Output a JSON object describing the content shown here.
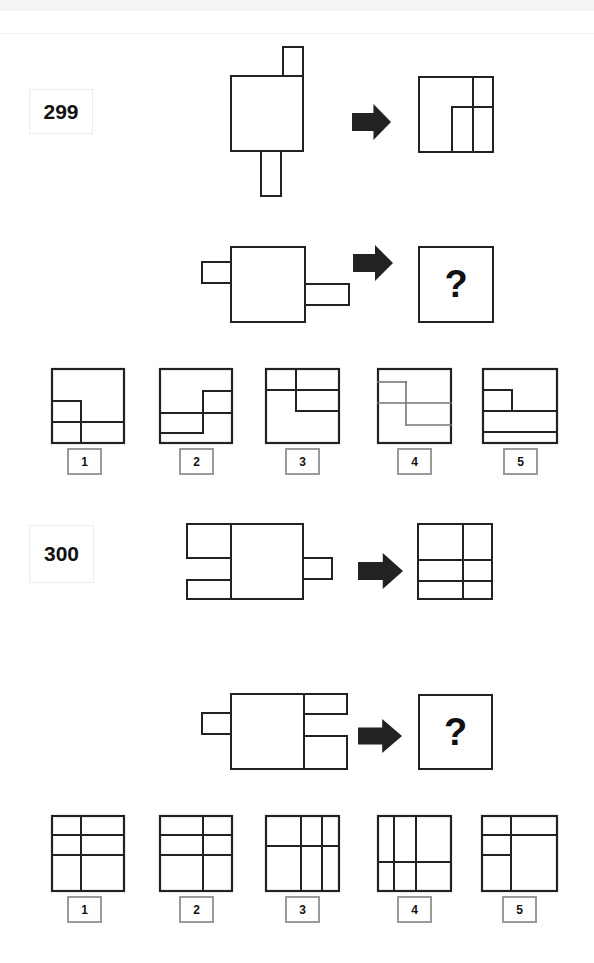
{
  "puzzles": [
    {
      "number": "299",
      "number_box": {
        "x": 29,
        "y": 89,
        "w": 64,
        "h": 45
      },
      "example": {
        "source": {
          "rects": [
            {
              "x": 231,
              "y": 76,
              "w": 72,
              "h": 75
            },
            {
              "x": 283,
              "y": 47,
              "w": 20,
              "h": 29
            },
            {
              "x": 261,
              "y": 151,
              "w": 20,
              "h": 45
            }
          ]
        },
        "arrow": {
          "x": 352,
          "y": 104,
          "w": 39,
          "h": 36
        },
        "result": {
          "box": {
            "x": 419,
            "y": 77,
            "w": 74,
            "h": 75
          },
          "lines": [
            [
              473,
              77,
              473,
              152
            ],
            [
              452,
              107,
              452,
              152
            ],
            [
              452,
              107,
              493,
              107
            ]
          ]
        }
      },
      "question": {
        "source": {
          "rects": [
            {
              "x": 231,
              "y": 247,
              "w": 74,
              "h": 75
            },
            {
              "x": 202,
              "y": 262,
              "w": 29,
              "h": 21
            },
            {
              "x": 305,
              "y": 284,
              "w": 44,
              "h": 21
            }
          ]
        },
        "arrow": {
          "x": 353,
          "y": 245,
          "w": 40,
          "h": 36
        },
        "answer_box": {
          "x": 419,
          "y": 247,
          "w": 74,
          "h": 75
        },
        "answer_glyph": "?"
      },
      "options": [
        {
          "label": "1",
          "box": {
            "x": 52,
            "y": 369,
            "w": 72,
            "h": 74
          },
          "label_pos": {
            "x": 67,
            "y": 448
          },
          "line_color": "#222",
          "lines": [
            [
              81,
              401,
              81,
              443
            ],
            [
              52,
              401,
              81,
              401
            ],
            [
              52,
              422,
              124,
              422
            ]
          ]
        },
        {
          "label": "2",
          "box": {
            "x": 160,
            "y": 369,
            "w": 72,
            "h": 74
          },
          "label_pos": {
            "x": 179,
            "y": 448
          },
          "line_color": "#222",
          "lines": [
            [
              203,
              391,
              232,
              391
            ],
            [
              203,
              391,
              203,
              433
            ],
            [
              160,
              413,
              232,
              413
            ],
            [
              160,
              433,
              203,
              433
            ]
          ]
        },
        {
          "label": "3",
          "box": {
            "x": 266,
            "y": 369,
            "w": 73,
            "h": 74
          },
          "label_pos": {
            "x": 285,
            "y": 448
          },
          "line_color": "#222",
          "lines": [
            [
              296,
              369,
              296,
              411
            ],
            [
              266,
              390,
              339,
              390
            ],
            [
              296,
              411,
              339,
              411
            ]
          ]
        },
        {
          "label": "4",
          "box": {
            "x": 378,
            "y": 369,
            "w": 73,
            "h": 74
          },
          "label_pos": {
            "x": 397,
            "y": 448
          },
          "line_color": "#777",
          "lines": [
            [
              378,
              382,
              406,
              382
            ],
            [
              406,
              382,
              406,
              425
            ],
            [
              378,
              403,
              451,
              403
            ],
            [
              406,
              425,
              451,
              425
            ]
          ]
        },
        {
          "label": "5",
          "box": {
            "x": 483,
            "y": 369,
            "w": 74,
            "h": 74
          },
          "label_pos": {
            "x": 503,
            "y": 448
          },
          "line_color": "#222",
          "lines": [
            [
              483,
              390,
              512,
              390
            ],
            [
              512,
              390,
              512,
              411
            ],
            [
              483,
              411,
              557,
              411
            ],
            [
              483,
              432,
              557,
              432
            ]
          ]
        }
      ]
    },
    {
      "number": "300",
      "number_box": {
        "x": 29,
        "y": 525,
        "w": 65,
        "h": 58
      },
      "example": {
        "source": {
          "rects": [
            {
              "x": 231,
              "y": 524,
              "w": 72,
              "h": 75
            },
            {
              "x": 187,
              "y": 524,
              "w": 44,
              "h": 34
            },
            {
              "x": 187,
              "y": 580,
              "w": 44,
              "h": 19
            },
            {
              "x": 303,
              "y": 558,
              "w": 29,
              "h": 21
            }
          ]
        },
        "arrow": {
          "x": 358,
          "y": 553,
          "w": 45,
          "h": 36
        },
        "result": {
          "box": {
            "x": 418,
            "y": 524,
            "w": 74,
            "h": 75
          },
          "lines": [
            [
              463,
              524,
              463,
              599
            ],
            [
              418,
              560,
              492,
              560
            ],
            [
              418,
              581,
              492,
              581
            ]
          ]
        }
      },
      "question": {
        "source": {
          "rects": [
            {
              "x": 231,
              "y": 694,
              "w": 73,
              "h": 75
            },
            {
              "x": 202,
              "y": 713,
              "w": 29,
              "h": 21
            },
            {
              "x": 304,
              "y": 694,
              "w": 43,
              "h": 20
            },
            {
              "x": 304,
              "y": 736,
              "w": 43,
              "h": 33
            }
          ]
        },
        "arrow": {
          "x": 358,
          "y": 719,
          "w": 44,
          "h": 34
        },
        "answer_box": {
          "x": 419,
          "y": 695,
          "w": 73,
          "h": 74
        },
        "answer_glyph": "?"
      },
      "options": [
        {
          "label": "1",
          "box": {
            "x": 52,
            "y": 816,
            "w": 72,
            "h": 75
          },
          "label_pos": {
            "x": 67,
            "y": 896
          },
          "line_color": "#222",
          "lines": [
            [
              81,
              816,
              81,
              891
            ],
            [
              52,
              835,
              124,
              835
            ],
            [
              52,
              855,
              124,
              855
            ]
          ]
        },
        {
          "label": "2",
          "box": {
            "x": 160,
            "y": 816,
            "w": 72,
            "h": 75
          },
          "label_pos": {
            "x": 179,
            "y": 896
          },
          "line_color": "#222",
          "lines": [
            [
              203,
              816,
              203,
              891
            ],
            [
              160,
              835,
              232,
              835
            ],
            [
              160,
              855,
              232,
              855
            ]
          ]
        },
        {
          "label": "3",
          "box": {
            "x": 266,
            "y": 816,
            "w": 73,
            "h": 75
          },
          "label_pos": {
            "x": 285,
            "y": 896
          },
          "line_color": "#222",
          "lines": [
            [
              266,
              846,
              339,
              846
            ],
            [
              301,
              816,
              301,
              891
            ],
            [
              322,
              816,
              322,
              891
            ]
          ]
        },
        {
          "label": "4",
          "box": {
            "x": 378,
            "y": 816,
            "w": 73,
            "h": 75
          },
          "label_pos": {
            "x": 397,
            "y": 896
          },
          "line_color": "#222",
          "lines": [
            [
              394,
              816,
              394,
              891
            ],
            [
              416,
              816,
              416,
              891
            ],
            [
              378,
              862,
              451,
              862
            ]
          ]
        },
        {
          "label": "5",
          "box": {
            "x": 482,
            "y": 816,
            "w": 75,
            "h": 75
          },
          "label_pos": {
            "x": 502,
            "y": 896
          },
          "line_color": "#222",
          "lines": [
            [
              511,
              816,
              511,
              891
            ],
            [
              482,
              835,
              557,
              835
            ],
            [
              482,
              855,
              511,
              855
            ]
          ]
        }
      ]
    }
  ],
  "colors": {
    "stroke": "#222222",
    "arrow": "#222222",
    "label_border": "#9a9a9a"
  }
}
